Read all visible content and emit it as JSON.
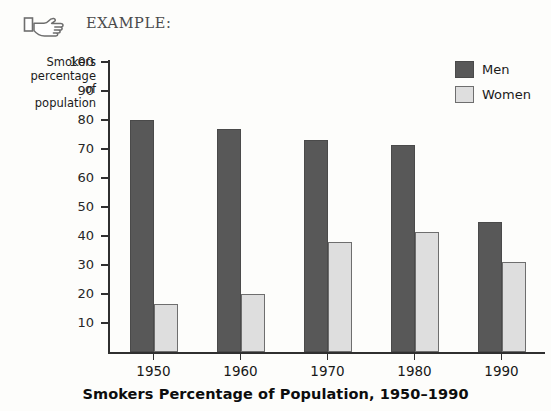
{
  "header": {
    "icon": "pointing-hand-icon",
    "label": "EXAMPLE:"
  },
  "legend": {
    "position": "top-right",
    "entries": [
      {
        "label": "Men",
        "color": "#585858"
      },
      {
        "label": "Women",
        "color": "#dedede"
      }
    ]
  },
  "axis": {
    "ylabel_lines": [
      "Smokers",
      "percentage of",
      "population"
    ],
    "yticks": [
      100,
      90,
      80,
      70,
      60,
      50,
      40,
      30,
      20,
      10
    ],
    "ytick_labels": [
      "100",
      "90",
      "80",
      "70",
      "60",
      "50",
      "40",
      "30",
      "20",
      "10"
    ]
  },
  "chart_data": {
    "type": "bar",
    "title": "Smokers Percentage of Population, 1950–1990",
    "xlabel": "",
    "ylabel": "Smokers percentage of population",
    "categories": [
      "1950",
      "1960",
      "1970",
      "1980",
      "1990"
    ],
    "series": [
      {
        "name": "Men",
        "color": "#585858",
        "values": [
          80,
          77,
          73,
          71.5,
          45
        ]
      },
      {
        "name": "Women",
        "color": "#dedede",
        "values": [
          16.5,
          20,
          38,
          41.5,
          31
        ]
      }
    ],
    "ylim": [
      0,
      100
    ],
    "ytick_step": 10,
    "grid": false,
    "legend_position": "top-right"
  }
}
